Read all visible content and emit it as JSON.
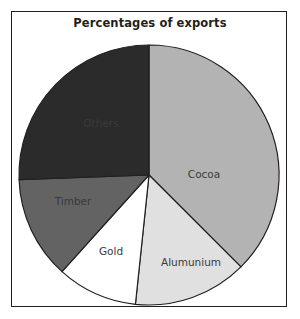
{
  "figure": {
    "title": "Percentages of exports",
    "background_color": "#ffffff",
    "frame_color": "#231f20"
  },
  "chart_data": {
    "type": "pie",
    "title": "Percentages of exports",
    "xlabel": "",
    "ylabel": "",
    "legend": "none",
    "labels_inside_slices": true,
    "start_angle_deg": 0,
    "direction": "clockwise",
    "categories": [
      "Cocoa",
      "Alumunium",
      "Gold",
      "Timber",
      "Others"
    ],
    "values": [
      37.5,
      14,
      10,
      13,
      25.5
    ],
    "units": "percent",
    "slices": [
      {
        "label": "Cocoa",
        "value": 37.5,
        "color": "#b3b3b3",
        "start_deg": 0,
        "end_deg": 135,
        "label_color": "#3a3a3a",
        "label_x": 193,
        "label_y": 167
      },
      {
        "label": "Alumunium",
        "value": 14,
        "color": "#e0e0e0",
        "start_deg": 135,
        "end_deg": 186,
        "label_color": "#3a3a3a",
        "label_x": 180,
        "label_y": 255
      },
      {
        "label": "Gold",
        "value": 10,
        "color": "#ffffff",
        "start_deg": 186,
        "end_deg": 222,
        "label_color": "#3a3a3a",
        "label_x": 100,
        "label_y": 244
      },
      {
        "label": "Timber",
        "value": 13,
        "color": "#636363",
        "start_deg": 222,
        "end_deg": 268,
        "label_color": "#f2f2f2",
        "label_x": 62,
        "label_y": 194
      },
      {
        "label": "Others",
        "value": 25.5,
        "color": "#2b2b2b",
        "start_deg": 268,
        "end_deg": 360,
        "label_color": "#ffffff",
        "label_x": 90,
        "label_y": 116
      }
    ],
    "center_x": 138,
    "center_y": 164,
    "radius": 130,
    "outline_color": "#231f20"
  }
}
